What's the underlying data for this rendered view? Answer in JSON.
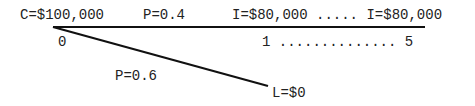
{
  "diagram": {
    "root": {
      "cost_label": "C=$100,000",
      "time_label": "0"
    },
    "upper_branch": {
      "probability_label": "P=0.4",
      "income_label": "I=$80,000 ..... I=$80,000",
      "period_label": "1 .............. 5"
    },
    "lower_branch": {
      "probability_label": "P=0.6",
      "loss_label": "L=$0"
    },
    "line_color": "#111111"
  }
}
